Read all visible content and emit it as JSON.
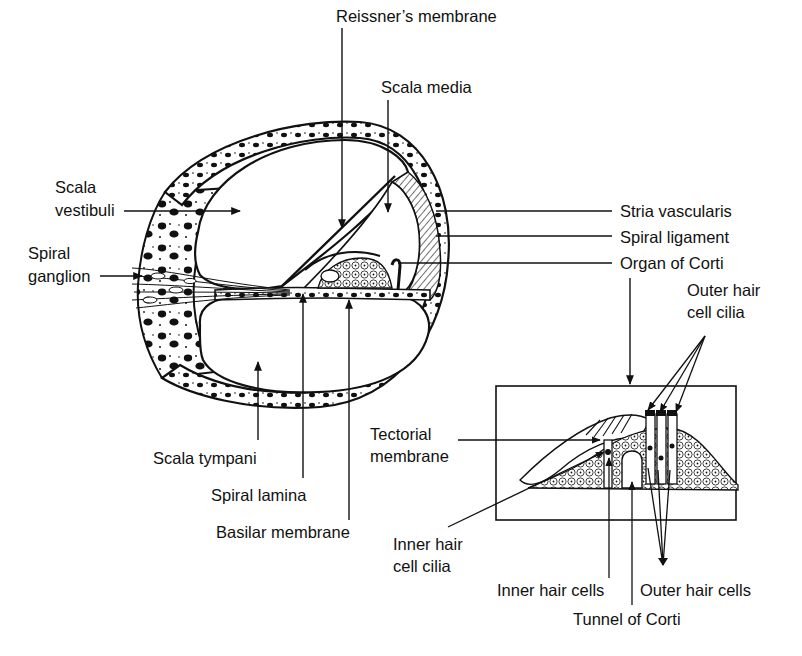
{
  "diagram": {
    "colors": {
      "ink": "#111111",
      "background": "#ffffff",
      "bone_speckle": "#111111"
    },
    "labels": {
      "reissners_membrane": "Reissner’s membrane",
      "scala_media": "Scala media",
      "scala_vestibuli_1": "Scala",
      "scala_vestibuli_2": "vestibuli",
      "spiral_ganglion_1": "Spiral",
      "spiral_ganglion_2": "ganglion",
      "stria_vascularis": "Stria vascularis",
      "spiral_ligament": "Spiral ligament",
      "organ_of_corti": "Organ of Corti",
      "outer_hair_cell_cilia_1": "Outer hair",
      "outer_hair_cell_cilia_2": "cell cilia",
      "tectorial_membrane_1": "Tectorial",
      "tectorial_membrane_2": "membrane",
      "scala_tympani": "Scala tympani",
      "spiral_lamina": "Spiral lamina",
      "basilar_membrane": "Basilar membrane",
      "inner_hair_cell_cilia_1": "Inner hair",
      "inner_hair_cell_cilia_2": "cell cilia",
      "inner_hair_cells": "Inner hair cells",
      "outer_hair_cells": "Outer hair cells",
      "tunnel_of_corti": "Tunnel of Corti"
    }
  }
}
